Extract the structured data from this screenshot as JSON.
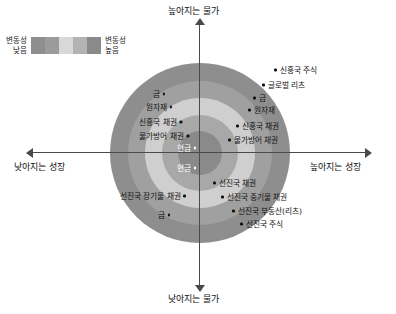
{
  "legend": {
    "low_label": "변동성\n낮음",
    "high_label": "변동성\n높음",
    "bands": [
      "#8e8e8e",
      "#9b9b9b",
      "#d8d8d8",
      "#b3b3b3",
      "#8a8a8a"
    ]
  },
  "axes": {
    "top_label": "높아지는 물가",
    "bottom_label": "낮아지는 물가",
    "left_label": "낮아지는 성장",
    "right_label": "높아지는 성장",
    "axis_color": "#4a4a4a"
  },
  "chart_data": {
    "type": "scatter",
    "title": "",
    "xlabel": "성장",
    "ylabel": "물가",
    "x_axis": {
      "negative": "낮아지는 성장",
      "positive": "높아지는 성장"
    },
    "y_axis": {
      "negative": "낮아지는 물가",
      "positive": "높아지는 물가"
    },
    "grid": false,
    "legend_position": "top-left",
    "annotation": "동심원은 변동성 수준을 나타냄 (중심=낮음, 바깥=높음)",
    "rings": [
      {
        "index": 1,
        "radius_px": 90,
        "color": "#8e8e8e",
        "volatility": "가장 높음"
      },
      {
        "index": 2,
        "radius_px": 72,
        "color": "#a0a0a0",
        "volatility": "높음"
      },
      {
        "index": 3,
        "radius_px": 55,
        "color": "#cfcfcf",
        "volatility": "보통"
      },
      {
        "index": 4,
        "radius_px": 38,
        "color": "#a8a8a8",
        "volatility": "낮음"
      },
      {
        "index": 5,
        "radius_px": 22,
        "color": "#8a8a8a",
        "volatility": "가장 낮음"
      }
    ],
    "quadrants": [
      {
        "name": "높아지는 물가 · 낮아지는 성장",
        "position": "upper-left",
        "points": [
          {
            "label": "금",
            "x": 165,
            "y": 94
          },
          {
            "label": "원자재",
            "x": 172,
            "y": 107
          },
          {
            "label": "신흥국 채권",
            "x": 182,
            "y": 122
          },
          {
            "label": "물가방어 채권",
            "x": 189,
            "y": 136
          },
          {
            "label": "현금",
            "x": 196,
            "y": 148,
            "white": true
          }
        ]
      },
      {
        "name": "높아지는 물가 · 높아지는 성장",
        "position": "upper-right",
        "points": [
          {
            "label": "신흥국 주식",
            "x": 274,
            "y": 70
          },
          {
            "label": "글로벌 리츠",
            "x": 262,
            "y": 85
          },
          {
            "label": "금",
            "x": 253,
            "y": 98
          },
          {
            "label": "원자재",
            "x": 248,
            "y": 110
          },
          {
            "label": "신흥국 채권",
            "x": 236,
            "y": 126
          },
          {
            "label": "물가방어 채권",
            "x": 228,
            "y": 140
          }
        ]
      },
      {
        "name": "낮아지는 물가 · 낮아지는 성장",
        "position": "lower-left",
        "points": [
          {
            "label": "현금",
            "x": 196,
            "y": 168,
            "white": true
          },
          {
            "label": "선진국 장기물 채권",
            "x": 186,
            "y": 196
          },
          {
            "label": "금",
            "x": 170,
            "y": 215
          }
        ]
      },
      {
        "name": "낮아지는 물가 · 높아지는 성장",
        "position": "lower-right",
        "points": [
          {
            "label": "선진국 채권",
            "x": 213,
            "y": 183
          },
          {
            "label": "선진국 중기물 채권",
            "x": 221,
            "y": 197
          },
          {
            "label": "선진국 부동산(리츠)",
            "x": 232,
            "y": 211
          },
          {
            "label": "선진국 주식",
            "x": 240,
            "y": 224
          }
        ]
      }
    ]
  }
}
